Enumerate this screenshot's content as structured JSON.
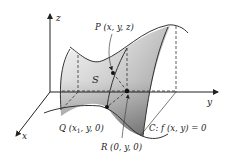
{
  "figure": {
    "type": "3d-surface-diagram",
    "axes": {
      "x_label": "x",
      "y_label": "y",
      "z_label": "z"
    },
    "surface_label": "S",
    "points": {
      "P": {
        "label": "P (x, y, z)"
      },
      "Q": {
        "label_main": "Q (x",
        "label_sub": "1",
        "label_rest": ", y, 0)"
      },
      "R": {
        "label": "R (0, y, 0)"
      }
    },
    "curve_label": "C: f (x, y) = 0",
    "colors": {
      "ink": "#222222",
      "surface_light": "#f2f2f2",
      "surface_dark": "#7a7a7a",
      "background": "#ffffff"
    }
  }
}
